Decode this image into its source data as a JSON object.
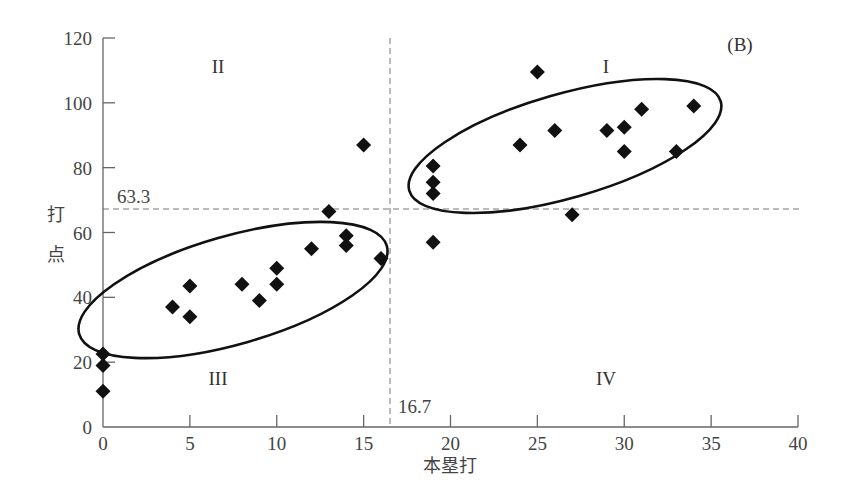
{
  "chart_data": {
    "type": "scatter",
    "title": "",
    "panel_label": "(B)",
    "xlabel": "本塁打",
    "ylabel": "打点",
    "xlim": [
      0,
      40
    ],
    "ylim": [
      0,
      120
    ],
    "xticks": [
      0,
      5,
      10,
      15,
      20,
      25,
      30,
      35,
      40
    ],
    "yticks": [
      0,
      20,
      40,
      60,
      80,
      100,
      120
    ],
    "grid": false,
    "marker": "diamond",
    "marker_color": "#111111",
    "reference_lines": [
      {
        "orientation": "horizontal",
        "value": 63.3,
        "label": "63.3",
        "style": "dashed"
      },
      {
        "orientation": "vertical",
        "value": 16.7,
        "label": "16.7",
        "style": "dashed"
      }
    ],
    "quadrant_labels": [
      {
        "label": "I",
        "x": 29,
        "y": 108
      },
      {
        "label": "II",
        "x": 6.5,
        "y": 108
      },
      {
        "label": "III",
        "x": 6.5,
        "y": 15
      },
      {
        "label": "IV",
        "x": 29,
        "y": 15
      }
    ],
    "clusters": [
      {
        "name": "III",
        "cx": 8.8,
        "cy": 42.5,
        "rx": 9.6,
        "ry": 3.2,
        "note": "ellipse around low-HR / low-RBI group"
      },
      {
        "name": "I",
        "cx": 26.1,
        "cy": 83,
        "rx": 9.6,
        "ry": 3.2,
        "note": "ellipse around high-HR / high-RBI group"
      }
    ],
    "points": [
      {
        "x": 0,
        "y": 22.5
      },
      {
        "x": 0,
        "y": 19
      },
      {
        "x": 0,
        "y": 11
      },
      {
        "x": 4,
        "y": 37
      },
      {
        "x": 5,
        "y": 43.5
      },
      {
        "x": 5,
        "y": 34
      },
      {
        "x": 8,
        "y": 44
      },
      {
        "x": 9,
        "y": 39
      },
      {
        "x": 10,
        "y": 49
      },
      {
        "x": 10,
        "y": 44
      },
      {
        "x": 12,
        "y": 55
      },
      {
        "x": 13,
        "y": 66.5
      },
      {
        "x": 14,
        "y": 59
      },
      {
        "x": 14,
        "y": 56
      },
      {
        "x": 15,
        "y": 87
      },
      {
        "x": 16,
        "y": 52
      },
      {
        "x": 19,
        "y": 80.5
      },
      {
        "x": 19,
        "y": 75.5
      },
      {
        "x": 19,
        "y": 72
      },
      {
        "x": 19,
        "y": 57
      },
      {
        "x": 24,
        "y": 87
      },
      {
        "x": 25,
        "y": 109.5
      },
      {
        "x": 26,
        "y": 91.5
      },
      {
        "x": 27,
        "y": 65.5
      },
      {
        "x": 29,
        "y": 91.5
      },
      {
        "x": 30,
        "y": 92.5
      },
      {
        "x": 30,
        "y": 85
      },
      {
        "x": 31,
        "y": 98
      },
      {
        "x": 33,
        "y": 85
      },
      {
        "x": 34,
        "y": 99
      }
    ]
  }
}
